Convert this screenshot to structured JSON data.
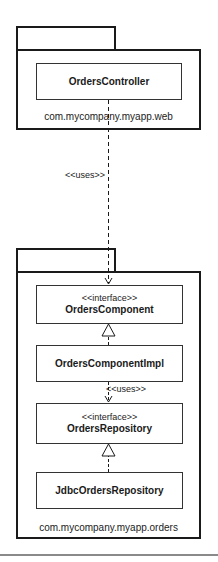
{
  "diagram": {
    "type": "UML package/class diagram",
    "packages": [
      {
        "name": "com.mycompany.myapp.web",
        "classes": [
          {
            "name": "OrdersController",
            "stereotype": ""
          }
        ]
      },
      {
        "name": "com.mycompany.myapp.orders",
        "classes": [
          {
            "name": "OrdersComponent",
            "stereotype": "<<interface>>"
          },
          {
            "name": "OrdersComponentImpl",
            "stereotype": ""
          },
          {
            "name": "OrdersRepository",
            "stereotype": "<<interface>>"
          },
          {
            "name": "JdbcOrdersRepository",
            "stereotype": ""
          }
        ]
      }
    ],
    "relationships": [
      {
        "from": "OrdersController",
        "to": "OrdersComponent",
        "type": "dependency",
        "label": "<<uses>>"
      },
      {
        "from": "OrdersComponentImpl",
        "to": "OrdersComponent",
        "type": "realization",
        "label": ""
      },
      {
        "from": "OrdersComponentImpl",
        "to": "OrdersRepository",
        "type": "dependency",
        "label": "<<uses>>"
      },
      {
        "from": "JdbcOrdersRepository",
        "to": "OrdersRepository",
        "type": "realization",
        "label": ""
      }
    ]
  },
  "colors": {
    "line": "#1a1a1a",
    "background": "#ffffff",
    "divider": "#8a8a8a"
  }
}
